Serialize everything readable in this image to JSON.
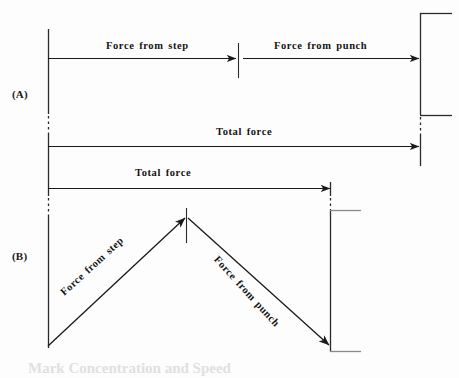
{
  "figure": {
    "background_color": "#fdfdfd",
    "line_color": "#1a1a1a",
    "panels": [
      {
        "id": "A",
        "label": "(A)",
        "description": "Collinear arrows: force from step followed by force from punch sum to total force",
        "arrows": [
          {
            "name": "force-from-step",
            "label": "Force from step",
            "x1": 48,
            "y1": 58,
            "x2": 236,
            "y2": 58,
            "style": "solid"
          },
          {
            "name": "force-from-punch",
            "label": "Force from punch",
            "x1": 243,
            "y1": 58,
            "x2": 419,
            "y2": 58,
            "style": "solid"
          },
          {
            "name": "total-force",
            "label": "Total force",
            "x1": 48,
            "y1": 146,
            "x2": 419,
            "y2": 146,
            "style": "solid"
          }
        ]
      },
      {
        "id": "B",
        "label": "(B)",
        "description": "Non-collinear arrows forming a triangle: step force up-right, punch force down-right, resultant total force horizontal",
        "arrows": [
          {
            "name": "total-force",
            "label": "Total force",
            "x1": 48,
            "y1": 188,
            "x2": 330,
            "y2": 188,
            "style": "solid"
          },
          {
            "name": "force-from-step",
            "label": "Force from step",
            "x1": 48,
            "y1": 345,
            "x2": 186,
            "y2": 216,
            "style": "solid"
          },
          {
            "name": "force-from-punch",
            "label": "Force from punch",
            "x1": 186,
            "y1": 216,
            "x2": 330,
            "y2": 345,
            "style": "solid"
          }
        ]
      }
    ],
    "labels": {
      "panel_a": "(A)",
      "panel_b": "(B)",
      "a_force_from_step": "Force from step",
      "a_force_from_punch": "Force from punch",
      "a_total_force": "Total force",
      "b_total_force": "Total force",
      "b_force_from_step": "Force from step",
      "b_force_from_punch": "Force from punch"
    },
    "caption_partial": "Mark Concentration and Speed"
  }
}
